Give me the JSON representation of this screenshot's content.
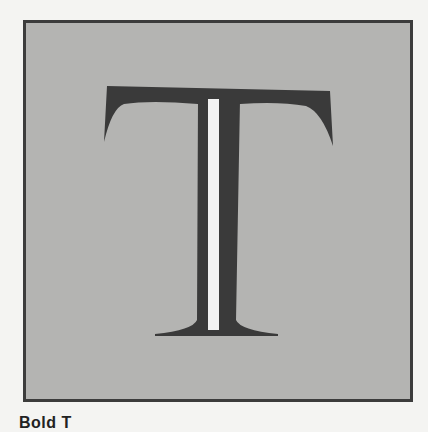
{
  "figure": {
    "glyph": "T",
    "glyph_description": "serif capital letter T with white highlight stripe on stem",
    "colors": {
      "background": "#b4b4b2",
      "border": "#3c3c3c",
      "glyph_fill": "#3a3a3a",
      "highlight": "#f2f2f2",
      "page": "#f4f4f2"
    }
  },
  "caption": {
    "text": "Bold T"
  }
}
